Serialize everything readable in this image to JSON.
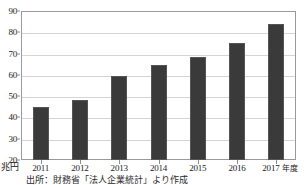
{
  "chart_data": {
    "type": "bar",
    "title": "",
    "subtitle": "",
    "xlabel": "年度",
    "ylabel": "兆円",
    "categories": [
      "2011",
      "2012",
      "2013",
      "2014",
      "2015",
      "2016",
      "2017"
    ],
    "values": [
      45.0,
      48.4,
      59.6,
      64.5,
      68.3,
      75.2,
      83.7
    ],
    "series": [
      {
        "name": "経常利益",
        "values": [
          45.0,
          48.4,
          59.6,
          64.5,
          68.3,
          75.2,
          83.7
        ]
      }
    ],
    "ylim": [
      20,
      90
    ],
    "y_ticks": [
      20,
      30,
      40,
      50,
      60,
      70,
      80,
      90
    ],
    "y_tick_labels": [
      "20",
      "30",
      "40",
      "50",
      "60",
      "70",
      "80",
      "90"
    ],
    "grid": true,
    "grid_axis": "y",
    "legend": false,
    "legend_position": "none",
    "bar_color": "#3a3a3a",
    "bar_edge_color": "#545454",
    "gridline_color": "#d4d4d4",
    "frame_color": "#9a9a9a",
    "background_color": "#ffffff"
  },
  "axes": {
    "y_unit_label": "兆円",
    "x_unit_suffix": "年度"
  },
  "caption": {
    "source_text": "出所：財務省「法人企業統計」より作成"
  }
}
